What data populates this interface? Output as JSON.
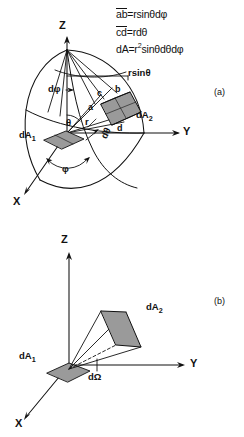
{
  "figure": {
    "type": "physics-diagram"
  },
  "equations": {
    "line1_over": "ab",
    "line1_rest": "=rsinθdφ",
    "line2_over": "cd",
    "line2_rest": "=rdθ",
    "line3_pre": "dA=r",
    "line3_sup": "2",
    "line3_post": "sinθdθdφ"
  },
  "panel_a": {
    "tag": "(a)",
    "axes": {
      "z": "Z",
      "y": "Y",
      "x": "X"
    },
    "labels": {
      "rsintheta": "rsinθ",
      "dphi_top": "dφ",
      "corner_c": "c",
      "corner_b": "b",
      "corner_a": "a",
      "corner_d": "d",
      "dA2": "dA",
      "dA2_sub": "2",
      "dA1": "dA",
      "dA1_sub": "1",
      "theta": "θ",
      "r": "r",
      "dtheta": "dθ",
      "phi": "φ"
    }
  },
  "panel_b": {
    "tag": "(b)",
    "axes": {
      "z": "Z",
      "y": "Y",
      "x": "X"
    },
    "labels": {
      "dA2": "dA",
      "dA2_sub": "2",
      "dA1": "dA",
      "dA1_sub": "1",
      "dOmega": "dΩ"
    }
  },
  "colors": {
    "ink": "#111111",
    "patch_fill": "#9a9a9a",
    "patch_fill_light": "#b4b4b4",
    "background": "#ffffff"
  }
}
